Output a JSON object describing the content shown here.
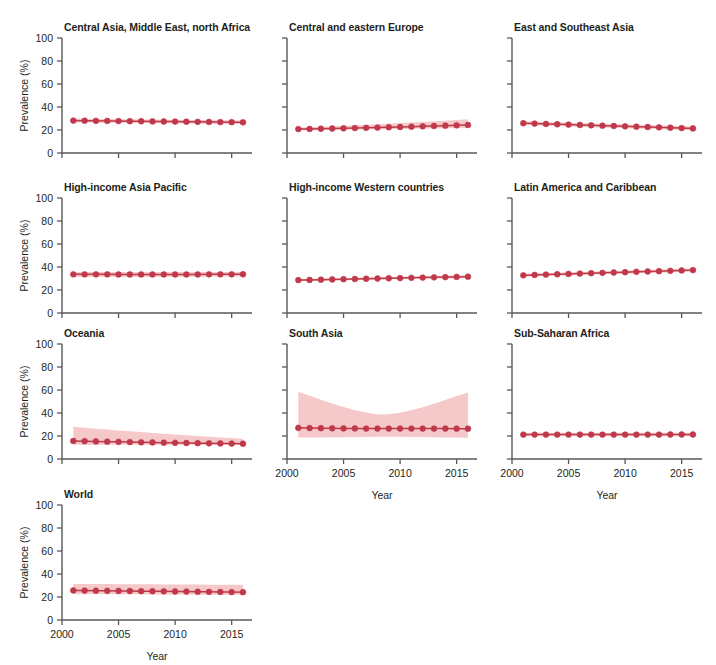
{
  "figure": {
    "kind": "small-multiples-line-chart",
    "ylabel": "Prevalence (%)",
    "xlabel": "Year",
    "y_ticks": [
      "0",
      "20",
      "40",
      "60",
      "80",
      "100"
    ],
    "x_ticks": [
      "2000",
      "2005",
      "2010",
      "2015"
    ],
    "colors": {
      "line": "#c0394b",
      "point": "#c0394b",
      "band": "#f4c3c6",
      "axis": "#58585b",
      "text": "#231f20",
      "background": "#ffffff"
    }
  },
  "chart_data": {
    "type": "line",
    "title": "",
    "xlabel": "Year",
    "ylabel": "Prevalence (%)",
    "xlim": [
      2000,
      2016.8
    ],
    "ylim": [
      0,
      100
    ],
    "xticks": [
      2000,
      2005,
      2010,
      2015
    ],
    "yticks": [
      0,
      20,
      40,
      60,
      80,
      100
    ],
    "grid": false,
    "legend": "none",
    "x": [
      2001,
      2002,
      2003,
      2004,
      2005,
      2006,
      2007,
      2008,
      2009,
      2010,
      2011,
      2012,
      2013,
      2014,
      2015,
      2016
    ],
    "panels": [
      {
        "name": "Central Asia, Middle East, north Africa",
        "row": 0,
        "col": 0,
        "values": [
          28.2,
          28.1,
          28.0,
          27.9,
          27.8,
          27.7,
          27.6,
          27.5,
          27.4,
          27.3,
          27.2,
          27.1,
          27.0,
          26.9,
          26.8,
          26.7
        ],
        "band_lower": [
          26.6,
          26.5,
          26.4,
          26.3,
          26.2,
          26.1,
          26.0,
          25.9,
          25.8,
          25.7,
          25.6,
          25.5,
          25.4,
          25.3,
          25.2,
          25.1
        ],
        "band_upper": [
          29.8,
          29.7,
          29.6,
          29.5,
          29.4,
          29.3,
          29.2,
          29.1,
          29.0,
          28.9,
          28.8,
          28.7,
          28.6,
          28.5,
          28.4,
          28.3
        ]
      },
      {
        "name": "Central and eastern Europe",
        "row": 0,
        "col": 1,
        "values": [
          20.8,
          20.9,
          21.1,
          21.3,
          21.5,
          21.7,
          21.9,
          22.1,
          22.4,
          22.6,
          22.9,
          23.2,
          23.5,
          23.8,
          24.1,
          24.4
        ],
        "band_lower": [
          19.6,
          19.7,
          19.9,
          20.1,
          20.2,
          20.4,
          20.5,
          20.6,
          20.8,
          20.9,
          21.0,
          21.2,
          21.3,
          21.5,
          21.6,
          21.8
        ],
        "band_upper": [
          22.1,
          22.4,
          22.8,
          23.2,
          23.6,
          24.1,
          24.5,
          25.0,
          25.5,
          26.0,
          26.5,
          27.0,
          27.6,
          28.1,
          28.7,
          29.3
        ]
      },
      {
        "name": "East and Southeast Asia",
        "row": 0,
        "col": 2,
        "values": [
          25.9,
          25.6,
          25.3,
          25.0,
          24.7,
          24.4,
          24.1,
          23.8,
          23.5,
          23.2,
          22.9,
          22.6,
          22.3,
          22.0,
          21.7,
          21.4
        ],
        "band_lower": [
          24.3,
          24.0,
          23.7,
          23.4,
          23.1,
          22.8,
          22.5,
          22.2,
          21.9,
          21.6,
          21.3,
          21.0,
          20.7,
          20.4,
          20.1,
          19.8
        ],
        "band_upper": [
          27.6,
          27.3,
          27.0,
          26.7,
          26.4,
          26.1,
          25.8,
          25.5,
          25.2,
          24.9,
          24.6,
          24.3,
          24.0,
          23.7,
          23.4,
          23.1
        ]
      },
      {
        "name": "High-income Asia Pacific",
        "row": 1,
        "col": 0,
        "values": [
          33.6,
          33.6,
          33.6,
          33.6,
          33.5,
          33.5,
          33.5,
          33.5,
          33.5,
          33.5,
          33.5,
          33.5,
          33.6,
          33.6,
          33.6,
          33.7
        ],
        "band_lower": [
          31.4,
          31.4,
          31.4,
          31.4,
          31.4,
          31.4,
          31.4,
          31.4,
          31.5,
          31.5,
          31.5,
          31.6,
          31.6,
          31.7,
          31.7,
          31.8
        ],
        "band_upper": [
          35.7,
          35.7,
          35.7,
          35.7,
          35.7,
          35.6,
          35.6,
          35.6,
          35.6,
          35.6,
          35.6,
          35.6,
          35.6,
          35.6,
          35.6,
          35.6
        ]
      },
      {
        "name": "High-income Western countries",
        "row": 1,
        "col": 1,
        "values": [
          28.6,
          28.8,
          29.0,
          29.2,
          29.4,
          29.6,
          29.8,
          30.0,
          30.2,
          30.4,
          30.6,
          30.8,
          31.0,
          31.2,
          31.4,
          31.6
        ],
        "band_lower": [
          27.6,
          27.8,
          28.0,
          28.2,
          28.4,
          28.6,
          28.8,
          29.0,
          29.2,
          29.3,
          29.5,
          29.7,
          29.9,
          30.0,
          30.2,
          30.4
        ],
        "band_upper": [
          29.6,
          29.8,
          30.0,
          30.2,
          30.4,
          30.6,
          30.9,
          31.1,
          31.3,
          31.5,
          31.7,
          31.9,
          32.1,
          32.3,
          32.6,
          32.8
        ]
      },
      {
        "name": "Latin America and Caribbean",
        "row": 1,
        "col": 2,
        "values": [
          32.8,
          33.1,
          33.4,
          33.7,
          34.0,
          34.3,
          34.6,
          34.9,
          35.2,
          35.5,
          35.8,
          36.1,
          36.4,
          36.7,
          37.0,
          37.3
        ],
        "band_lower": [
          31.5,
          31.8,
          32.1,
          32.4,
          32.7,
          33.0,
          33.3,
          33.6,
          33.9,
          34.2,
          34.5,
          34.8,
          35.1,
          35.4,
          35.7,
          36.0
        ],
        "band_upper": [
          34.2,
          34.5,
          34.8,
          35.1,
          35.4,
          35.7,
          36.0,
          36.3,
          36.6,
          36.9,
          37.2,
          37.5,
          37.8,
          38.1,
          38.4,
          38.7
        ]
      },
      {
        "name": "Oceania",
        "row": 2,
        "col": 0,
        "values": [
          15.7,
          15.5,
          15.3,
          15.1,
          14.9,
          14.7,
          14.5,
          14.4,
          14.2,
          14.1,
          13.9,
          13.8,
          13.6,
          13.5,
          13.4,
          13.3
        ],
        "band_lower": [
          12.3,
          12.3,
          12.3,
          12.3,
          12.3,
          12.3,
          12.3,
          12.3,
          12.3,
          12.3,
          12.3,
          12.2,
          12.2,
          12.2,
          12.2,
          12.2
        ],
        "band_upper": [
          28.0,
          27.2,
          26.4,
          25.6,
          24.8,
          24.1,
          23.4,
          22.7,
          22.0,
          21.3,
          20.7,
          20.0,
          19.4,
          18.8,
          18.2,
          17.6
        ]
      },
      {
        "name": "South Asia",
        "row": 2,
        "col": 1,
        "values": [
          27.1,
          26.9,
          26.8,
          26.7,
          26.6,
          26.6,
          26.5,
          26.5,
          26.5,
          26.5,
          26.5,
          26.5,
          26.5,
          26.5,
          26.4,
          26.4
        ],
        "band_lower": [
          18.6,
          18.7,
          18.8,
          18.9,
          19.0,
          19.1,
          19.2,
          19.3,
          19.3,
          19.3,
          19.2,
          19.1,
          19.0,
          18.8,
          18.6,
          18.4
        ],
        "band_upper": [
          58.5,
          55.0,
          51.5,
          48.2,
          45.2,
          42.5,
          40.4,
          38.8,
          38.9,
          40.3,
          42.4,
          45.0,
          48.0,
          51.3,
          54.7,
          57.8
        ]
      },
      {
        "name": "Sub-Saharan Africa",
        "row": 2,
        "col": 2,
        "values": [
          21.2,
          21.2,
          21.2,
          21.2,
          21.2,
          21.2,
          21.2,
          21.2,
          21.2,
          21.2,
          21.2,
          21.2,
          21.2,
          21.3,
          21.3,
          21.3
        ],
        "band_lower": [
          19.7,
          19.7,
          19.7,
          19.7,
          19.7,
          19.7,
          19.7,
          19.7,
          19.7,
          19.7,
          19.7,
          19.7,
          19.7,
          19.8,
          19.8,
          19.8
        ],
        "band_upper": [
          22.8,
          22.8,
          22.8,
          22.8,
          22.8,
          22.8,
          22.8,
          22.8,
          22.8,
          22.8,
          22.8,
          22.8,
          22.8,
          22.9,
          22.9,
          22.9
        ]
      },
      {
        "name": "World",
        "row": 3,
        "col": 0,
        "values": [
          25.7,
          25.6,
          25.5,
          25.4,
          25.3,
          25.2,
          25.1,
          25.0,
          24.9,
          24.8,
          24.7,
          24.6,
          24.5,
          24.4,
          24.3,
          24.2
        ],
        "band_lower": [
          22.6,
          22.5,
          22.5,
          22.4,
          22.4,
          22.3,
          22.3,
          22.2,
          22.2,
          22.1,
          22.1,
          22.0,
          22.0,
          21.9,
          21.9,
          21.8
        ],
        "band_upper": [
          31.4,
          31.3,
          31.2,
          31.2,
          31.1,
          31.1,
          31.0,
          31.0,
          30.9,
          30.9,
          30.8,
          30.8,
          30.7,
          30.7,
          30.6,
          30.6
        ]
      }
    ]
  }
}
